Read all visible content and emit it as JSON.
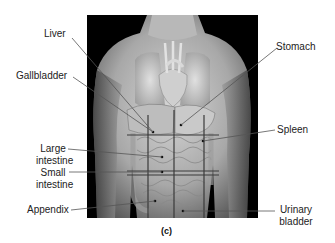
{
  "figure": {
    "caption": "(c)",
    "labels_left": {
      "liver": "Liver",
      "gallbladder": "Gallbladder",
      "large_intestine_1": "Large",
      "large_intestine_2": "intestine",
      "small_intestine_1": "Small",
      "small_intestine_2": "intestine",
      "appendix": "Appendix"
    },
    "labels_right": {
      "stomach": "Stomach",
      "spleen": "Spleen",
      "urinary_bladder_1": "Urinary",
      "urinary_bladder_2": "bladder"
    },
    "colors": {
      "background": "#000000",
      "skin_light": "#c8c8c8",
      "skin_mid": "#9a9a9a",
      "grid_line": "#3a3a3a",
      "leader_line": "#555555",
      "label_text": "#222222"
    },
    "grid": {
      "description": "Abdominopelvic quadrant/region grid overlay",
      "vertical_lines": 3,
      "horizontal_lines": 3
    }
  }
}
